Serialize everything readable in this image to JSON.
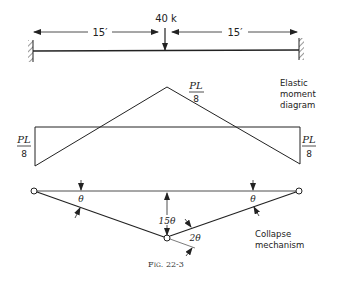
{
  "beam": {
    "load_label": "40 k",
    "span_left": "15′",
    "span_right": "15′",
    "supports": [
      "fixed",
      "fixed"
    ]
  },
  "moment_diagram": {
    "peak_label_num": "PL",
    "peak_label_den": "8",
    "left_label_num": "PL",
    "left_label_den": "8",
    "right_label_num": "PL",
    "right_label_den": "8",
    "title_lines": [
      "Elastic",
      "moment",
      "diagram"
    ]
  },
  "mechanism": {
    "left_angle": "θ",
    "right_angle": "θ",
    "center_deflection": "15θ",
    "center_angle": "2θ",
    "title_lines": [
      "Collapse",
      "mechanism"
    ]
  },
  "caption": "Fig. 22-3"
}
